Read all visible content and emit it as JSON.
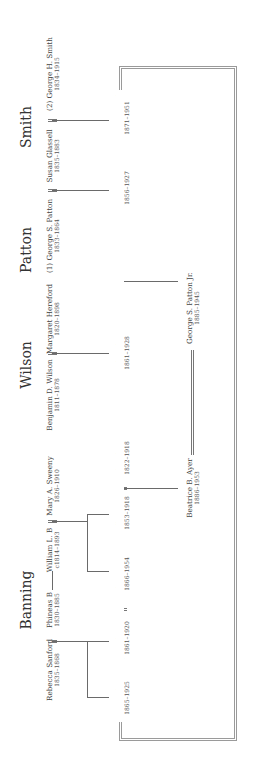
{
  "families": [
    {
      "name": "Banning"
    },
    {
      "name": "Wilson"
    },
    {
      "name": "Patton"
    },
    {
      "name": "Smith"
    }
  ],
  "people": {
    "rebecca_sanford": {
      "name": "Rebecca Sanford",
      "dates": "1835–1868"
    },
    "phineas_b": {
      "name": "Phineas B",
      "dates": "1830–1885"
    },
    "william_l_b": {
      "name": "William L. B",
      "dates": "c1814–1893"
    },
    "mary_a_sweeny": {
      "name": "Mary A. Sweeny",
      "dates": "1826–1910"
    },
    "benjamin_d_wilson": {
      "name": "Benjamin D. Wilson",
      "dates": "1811–1878"
    },
    "margaret_hereford": {
      "name": "Margaret Hereford",
      "dates": "1820–1898"
    },
    "george_s_patton_1": {
      "name": "(1) George S. Patton",
      "dates": "1833–1864"
    },
    "susan_glassell": {
      "name": "Susan Glassell",
      "dates": "1835–1883"
    },
    "george_h_smith": {
      "name": "(2) George H. Smith",
      "dates": "1834–1915"
    },
    "hancock_b": {
      "name": "Hancock B",
      "dates": "1865–1925"
    },
    "joseph_b_b": {
      "name": "Joseph B. B",
      "dates": "1861–1920"
    },
    "katharine_s_b": {
      "name": "Katharine S. B",
      "dates": "1866–1954"
    },
    "ellen_b_b": {
      "name": "Ellen B. B",
      "dates": "1853–1918"
    },
    "frederick_ayer": {
      "name": "Frederick Ayer",
      "dates": "1822–1918"
    },
    "ruth_wilson": {
      "name": "Ruth Wilson",
      "dates": "1861–1928"
    },
    "george_s_patton_sr": {
      "name": "George S. Patton Sr",
      "dates": "1856–1927"
    },
    "anne_o_smith": {
      "name": "Anne O. Smith",
      "dates": "1871–1951"
    },
    "beatrice_b_ayer": {
      "name": "Beatrice B. Ayer",
      "dates": "1886–1953"
    },
    "george_s_patton_jr": {
      "name": "George S. Patton Jr.",
      "dates": "1885–1945"
    }
  },
  "colors": {
    "line": "#6a6a6a",
    "frame": "#9a9a9a",
    "text": "#3a3a3a"
  }
}
